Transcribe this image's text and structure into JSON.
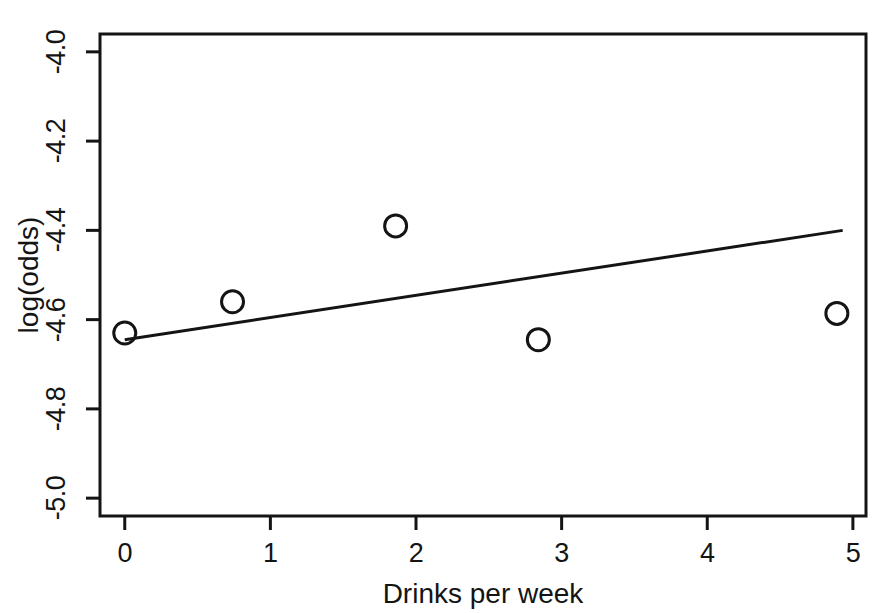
{
  "chart_data": {
    "type": "scatter",
    "title": "",
    "xlabel": "Drinks per week",
    "ylabel": "log(odds)",
    "xlim": [
      -0.17,
      5.09
    ],
    "ylim": [
      -5.04,
      -3.96
    ],
    "grid": false,
    "legend": "none",
    "x_ticks": [
      "0",
      "1",
      "2",
      "3",
      "4",
      "5"
    ],
    "x_tick_values": [
      0,
      1,
      2,
      3,
      4,
      5
    ],
    "y_ticks": [
      "-4.0",
      "-4.2",
      "-4.4",
      "-4.6",
      "-4.8",
      "-5.0"
    ],
    "y_tick_values": [
      -4.0,
      -4.2,
      -4.4,
      -4.6,
      -4.8,
      -5.0
    ],
    "series": [
      {
        "name": "observed-log-odds",
        "type": "scatter",
        "marker": "open-circle",
        "color": "#141414",
        "points": [
          {
            "x": 0.0,
            "y": -4.63
          },
          {
            "x": 0.74,
            "y": -4.56
          },
          {
            "x": 1.86,
            "y": -4.39
          },
          {
            "x": 2.84,
            "y": -4.645
          },
          {
            "x": 4.89,
            "y": -4.586
          }
        ]
      },
      {
        "name": "fitted-regression-line",
        "type": "line",
        "color": "#141414",
        "points": [
          {
            "x": 0.0,
            "y": -4.645
          },
          {
            "x": 4.93,
            "y": -4.4
          }
        ]
      }
    ]
  },
  "axes": {
    "x_title": "Drinks per week",
    "y_title": "log(odds)"
  }
}
